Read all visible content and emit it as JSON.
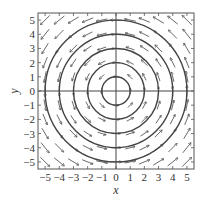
{
  "chart_data": {
    "type": "vector_field",
    "title": "",
    "xlabel": "x",
    "ylabel": "y",
    "xlim": [
      -5.5,
      5.5
    ],
    "ylim": [
      -5.5,
      5.5
    ],
    "xticks": [
      -5,
      -4,
      -3,
      -2,
      -1,
      0,
      1,
      2,
      3,
      4,
      5
    ],
    "yticks": [
      -5,
      -4,
      -3,
      -2,
      -1,
      0,
      1,
      2,
      3,
      4,
      5
    ],
    "field": {
      "u": "-y",
      "v": "x",
      "description": "counterclockwise rotational field"
    },
    "grid_spacing": 1,
    "circles": {
      "center": [
        0,
        0
      ],
      "radii": [
        1,
        2,
        3,
        4,
        5
      ]
    },
    "axes_lines": true,
    "colors": {
      "stroke": "#444444",
      "frame": "#555555",
      "background": "#ffffff"
    }
  }
}
